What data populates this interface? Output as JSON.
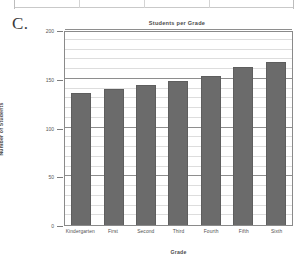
{
  "letter_label": "C.",
  "chart_data": {
    "type": "bar",
    "title": "Students per Grade",
    "xlabel": "Grade",
    "ylabel": "Number of Students",
    "categories": [
      "Kindergarten",
      "First",
      "Second",
      "Third",
      "Fourth",
      "Fifth",
      "Sixth"
    ],
    "values": [
      135,
      140,
      144,
      148,
      153,
      162,
      167
    ],
    "ylim": [
      0,
      200
    ],
    "ytick_labels": [
      "0",
      "50",
      "100",
      "150",
      "200"
    ],
    "ytick_values": [
      0,
      50,
      100,
      150,
      200
    ],
    "minor_gridline_step": 10,
    "grid": true,
    "legend": "none",
    "bar_color": "#6b6b6b",
    "major_gridline_color": "#8e8e8e",
    "minor_gridline_color": "#dddddd",
    "axis_color": "#8a8a8a"
  }
}
